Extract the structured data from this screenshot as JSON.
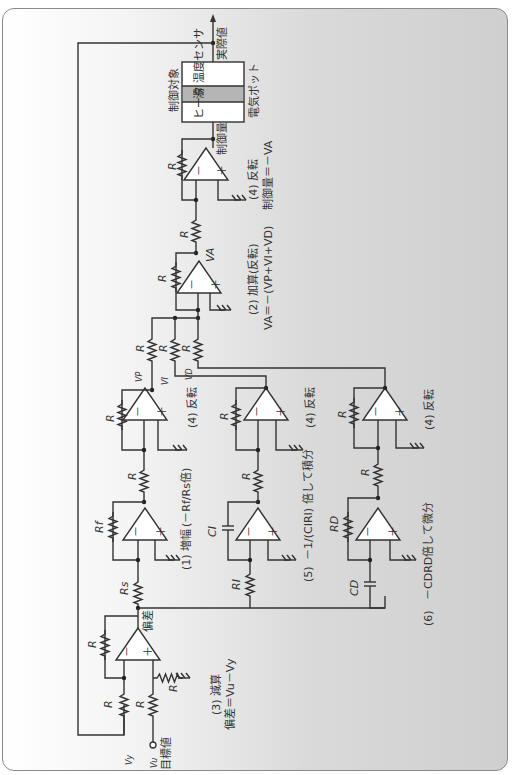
{
  "diagram": {
    "orientation": "rotated 90deg clockwise",
    "colors": {
      "background_left": "#ffffff",
      "background_right": "#cfcfcf",
      "line": "#333333",
      "tank": "#b5b5b5"
    },
    "signals": {
      "setpoint_label": "目標値",
      "setpoint_symbol": "Vu",
      "feedback_symbol": "Vy",
      "actual_value_label": "実際値",
      "error_label": "偏差",
      "vp": "VP",
      "vi": "VI",
      "vd": "VD",
      "va": "VA",
      "control_amount_label": "制御量"
    },
    "plant": {
      "title": "制御対象",
      "sensor": "温度センサ",
      "tank": "湯",
      "heater": "ヒータ",
      "caption": "電気ポット"
    },
    "components": {
      "R": "R",
      "Rs": "Rs",
      "Rf": "Rf",
      "RI": "RI",
      "CI": "CI",
      "RD": "RD",
      "CD": "CD"
    },
    "stages": [
      {
        "id": "subtract",
        "label": "(3) 減算",
        "formula": "偏差＝Vu－Vy"
      },
      {
        "id": "proportional",
        "label": "(1) 増幅",
        "formula": "(－Rf/Rs倍)"
      },
      {
        "id": "integral",
        "label": "(5)",
        "formula": "－1/(CIRI) 倍して積分"
      },
      {
        "id": "derivative",
        "label": "(6)",
        "formula": "－CDRD倍して微分"
      },
      {
        "id": "invert_p",
        "label": "(4) 反転"
      },
      {
        "id": "invert_i",
        "label": "(4) 反転"
      },
      {
        "id": "invert_d",
        "label": "(4) 反転"
      },
      {
        "id": "adder",
        "label": "(2) 加算(反転)",
        "formula": "VA＝－(VP+VI+VD)"
      },
      {
        "id": "invert_out",
        "label": "(4) 反転",
        "formula": "制御量＝－VA"
      }
    ],
    "opamp_pins": {
      "minus": "－",
      "plus": "＋"
    }
  }
}
